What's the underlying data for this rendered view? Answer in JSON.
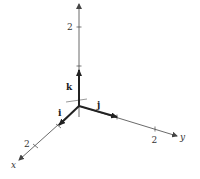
{
  "diagram": {
    "type": "3d-coordinate-axes",
    "axes": {
      "x": {
        "label": "x",
        "tick_label": "2"
      },
      "y": {
        "label": "y",
        "tick_label": "2"
      },
      "z": {
        "tick_label": "2"
      }
    },
    "unit_vectors": {
      "i": "i",
      "j": "j",
      "k": "k"
    },
    "colors": {
      "axis": "#444444",
      "vector": "#222222",
      "background": "#ffffff"
    }
  }
}
